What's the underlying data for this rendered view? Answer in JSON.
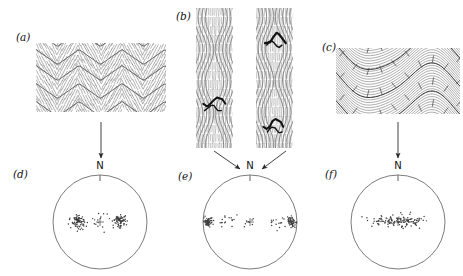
{
  "figure": {
    "kind": "structural-geology-fold-and-stereonet-figure",
    "background_color": "#ffffff",
    "ink_color": "#2b2b2b",
    "width": 463,
    "height": 276
  },
  "panels": [
    {
      "id": "a",
      "label": "(a)",
      "label_x": 16,
      "label_y": 31,
      "type": "fold-profile-sketch",
      "description": "chevron folds with cleavage fans",
      "box": {
        "x": 36,
        "y": 43,
        "w": 130,
        "h": 69
      },
      "style": "chevron"
    },
    {
      "id": "b",
      "label": "(b)",
      "label_x": 176,
      "label_y": 12,
      "type": "fold-profile-sketch",
      "description": "two vertical fold profiles with dark marker beds",
      "boxes": [
        {
          "x": 196,
          "y": 8,
          "w": 37,
          "h": 140
        },
        {
          "x": 256,
          "y": 8,
          "w": 37,
          "h": 140
        }
      ],
      "style": "vertical-pair"
    },
    {
      "id": "c",
      "label": "(c)",
      "label_x": 322,
      "label_y": 41,
      "type": "fold-profile-sketch",
      "description": "rounded asymmetric folds with cleavage ticks",
      "box": {
        "x": 336,
        "y": 48,
        "w": 124,
        "h": 66
      },
      "style": "rounded"
    },
    {
      "id": "d",
      "label": "(d)",
      "label_x": 13,
      "label_y": 170,
      "type": "stereonet",
      "north_label": "N",
      "center": {
        "x": 100,
        "y": 222
      },
      "radius": 47
    },
    {
      "id": "e",
      "label": "(e)",
      "label_x": 178,
      "label_y": 172,
      "type": "stereonet",
      "north_label": "N",
      "center": {
        "x": 250,
        "y": 222
      },
      "radius": 47
    },
    {
      "id": "f",
      "label": "(f)",
      "label_x": 325,
      "label_y": 170,
      "type": "stereonet",
      "north_label": "N",
      "center": {
        "x": 398,
        "y": 222
      },
      "radius": 47
    }
  ],
  "arrows": [
    {
      "name": "arrow-a-to-d",
      "from": {
        "x": 101,
        "y": 122
      },
      "to": {
        "x": 101,
        "y": 160
      },
      "kind": "vertical"
    },
    {
      "name": "arrow-b-left-to-e",
      "from": {
        "x": 217,
        "y": 152
      },
      "to": {
        "x": 242,
        "y": 170
      },
      "kind": "diagonal"
    },
    {
      "name": "arrow-b-right-to-e",
      "from": {
        "x": 283,
        "y": 152
      },
      "to": {
        "x": 260,
        "y": 170
      },
      "kind": "diagonal"
    },
    {
      "name": "arrow-c-to-f",
      "from": {
        "x": 398,
        "y": 122
      },
      "to": {
        "x": 398,
        "y": 160
      },
      "kind": "vertical"
    }
  ],
  "chart_data": {
    "type": "scatter",
    "title": "",
    "subtitle": "",
    "xlabel": "",
    "ylabel": "",
    "projection": "equal-area lower hemisphere stereographic net",
    "orientation_marker": "N",
    "grid": false,
    "legend": null,
    "plots": [
      {
        "panel": "d",
        "name": "pole-plot-chevron-folds",
        "center_symbol": "+",
        "center": {
          "x": 0,
          "y": 0
        },
        "radius_normalized": 1.0,
        "clusters": [
          {
            "name": "west-maximum",
            "cx": -0.47,
            "cy": -0.02,
            "spread": 0.14,
            "count": 78,
            "density": "high"
          },
          {
            "name": "east-maximum",
            "cx": 0.42,
            "cy": -0.02,
            "spread": 0.14,
            "count": 74,
            "density": "high"
          },
          {
            "name": "central-scatter",
            "cx": -0.02,
            "cy": -0.02,
            "spread": 0.22,
            "count": 14,
            "density": "low"
          }
        ],
        "pattern": "two discrete point maxima separated by sparse girdle"
      },
      {
        "panel": "e",
        "name": "pole-plot-vertical-folds",
        "center_symbol": "+",
        "center": {
          "x": 0,
          "y": 0
        },
        "radius_normalized": 1.0,
        "clusters": [
          {
            "name": "west-margin-maximum",
            "cx": -0.89,
            "cy": -0.01,
            "spread": 0.1,
            "count": 60,
            "density": "high"
          },
          {
            "name": "east-margin-maximum",
            "cx": 0.89,
            "cy": -0.01,
            "spread": 0.1,
            "count": 58,
            "density": "high"
          },
          {
            "name": "west-tail",
            "cx": -0.52,
            "cy": -0.01,
            "spread": 0.2,
            "count": 16,
            "density": "low"
          },
          {
            "name": "east-tail",
            "cx": 0.52,
            "cy": -0.01,
            "spread": 0.2,
            "count": 14,
            "density": "low"
          },
          {
            "name": "central-scatter",
            "cx": 0.0,
            "cy": -0.01,
            "spread": 0.14,
            "count": 8,
            "density": "low"
          }
        ],
        "pattern": "two peripheral maxima at the east and west margins of the net"
      },
      {
        "panel": "f",
        "name": "pole-plot-rounded-folds",
        "center_symbol": "+",
        "center": {
          "x": 0,
          "y": 0
        },
        "radius_normalized": 1.0,
        "clusters": [
          {
            "name": "east-west-girdle",
            "cx": 0.0,
            "cy": -0.02,
            "spread_x": 0.56,
            "spread_y": 0.12,
            "count": 135,
            "density": "medium"
          }
        ],
        "pattern": "continuous east-west girdle of evenly dispersed poles"
      }
    ]
  }
}
